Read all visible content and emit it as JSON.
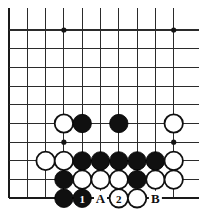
{
  "figure": {
    "name": "go-board-diagram",
    "type": "go-problem-diagram",
    "width": 199,
    "height": 224,
    "background_color": "#ffffff",
    "line_color": "#2b2b2b",
    "black_stone_color": "#101010",
    "white_stone_color": "#ffffff"
  },
  "board": {
    "columns": 10,
    "rows": 10,
    "origin_x": 9,
    "origin_y": 30,
    "spacing_x": 18.3,
    "spacing_y": 18.7,
    "left_edge_is_board_edge": true,
    "bottom_edge_is_board_edge": true,
    "stone_radius": 9.2,
    "star_point_radius": 2.6,
    "star_points": [
      {
        "col": 3,
        "row": 0
      },
      {
        "col": 9,
        "row": 0
      },
      {
        "col": 3,
        "row": 6
      },
      {
        "col": 9,
        "row": 6
      }
    ]
  },
  "stones": [
    {
      "col": 3,
      "row": 5,
      "color": "white",
      "label": ""
    },
    {
      "col": 4,
      "row": 5,
      "color": "black",
      "label": ""
    },
    {
      "col": 6,
      "row": 5,
      "color": "black",
      "label": ""
    },
    {
      "col": 9,
      "row": 5,
      "color": "white",
      "label": ""
    },
    {
      "col": 2,
      "row": 7,
      "color": "white",
      "label": ""
    },
    {
      "col": 3,
      "row": 7,
      "color": "white",
      "label": ""
    },
    {
      "col": 4,
      "row": 7,
      "color": "black",
      "label": ""
    },
    {
      "col": 5,
      "row": 7,
      "color": "black",
      "label": ""
    },
    {
      "col": 6,
      "row": 7,
      "color": "black",
      "label": ""
    },
    {
      "col": 7,
      "row": 7,
      "color": "black",
      "label": ""
    },
    {
      "col": 8,
      "row": 7,
      "color": "black",
      "label": ""
    },
    {
      "col": 9,
      "row": 7,
      "color": "white",
      "label": ""
    },
    {
      "col": 3,
      "row": 8,
      "color": "black",
      "label": ""
    },
    {
      "col": 4,
      "row": 8,
      "color": "white",
      "label": ""
    },
    {
      "col": 5,
      "row": 8,
      "color": "white",
      "label": ""
    },
    {
      "col": 6,
      "row": 8,
      "color": "white",
      "label": ""
    },
    {
      "col": 7,
      "row": 8,
      "color": "black",
      "label": ""
    },
    {
      "col": 8,
      "row": 8,
      "color": "white",
      "label": ""
    },
    {
      "col": 9,
      "row": 8,
      "color": "white",
      "label": ""
    },
    {
      "col": 3,
      "row": 9,
      "color": "black",
      "label": ""
    },
    {
      "col": 4,
      "row": 9,
      "color": "black",
      "label": "1"
    },
    {
      "col": 6,
      "row": 9,
      "color": "white",
      "label": "2"
    },
    {
      "col": 7,
      "row": 9,
      "color": "white",
      "label": ""
    }
  ],
  "point_labels": [
    {
      "col": 5,
      "row": 9,
      "text": "A"
    },
    {
      "col": 8,
      "row": 9,
      "text": "B"
    }
  ],
  "move_numbers": {
    "black_move": "1",
    "white_move": "2"
  }
}
